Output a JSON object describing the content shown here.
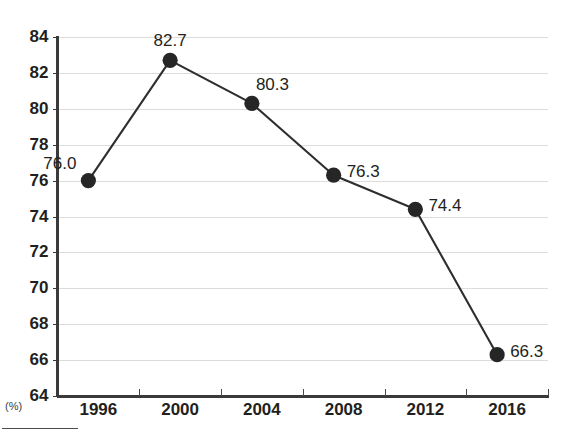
{
  "chart_data": {
    "type": "line",
    "title": "",
    "subtitle": "",
    "xlabel": "",
    "ylabel": "",
    "unit_label": "(%)",
    "categories": [
      "1996",
      "2000",
      "2004",
      "2008",
      "2012",
      "2016"
    ],
    "values": [
      76.0,
      82.7,
      80.3,
      76.3,
      74.4,
      66.3
    ],
    "point_labels": [
      "76.0",
      "82.7",
      "80.3",
      "76.3",
      "74.4",
      "66.3"
    ],
    "label_positions": [
      "left",
      "above",
      "above-right",
      "right",
      "right",
      "right"
    ],
    "ylim": [
      64,
      84
    ],
    "ytick_values": [
      64,
      66,
      68,
      70,
      72,
      74,
      76,
      78,
      80,
      82,
      84
    ],
    "ytick_labels": [
      "64",
      "66",
      "68",
      "70",
      "72",
      "74",
      "76",
      "78",
      "80",
      "82",
      "84"
    ],
    "grid": true,
    "grid_axis": "y",
    "legend": false,
    "legend_position": "none",
    "marker": "circle",
    "series": [
      {
        "name": "",
        "values": [
          76.0,
          82.7,
          80.3,
          76.3,
          74.4,
          66.3
        ]
      }
    ],
    "colors": {
      "line": "#2e2e2e",
      "marker": "#262626",
      "grid": "#dcdcdc",
      "axis": "#3a3a3a",
      "text": "#231f20",
      "background": "#ffffff"
    }
  }
}
